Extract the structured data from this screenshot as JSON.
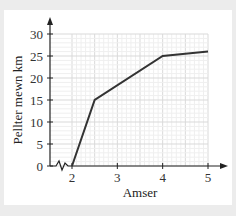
{
  "chart_data": {
    "type": "line",
    "title": "",
    "xlabel": "Amser",
    "ylabel": "Pellter mewn km",
    "x": [
      2,
      2.5,
      4,
      5
    ],
    "series": [
      {
        "name": "Pellter",
        "values": [
          0,
          15,
          25,
          26
        ]
      }
    ],
    "xticks": [
      "2",
      "3",
      "4",
      "5"
    ],
    "yticks": [
      "0",
      "5",
      "10",
      "15",
      "20",
      "25",
      "30"
    ],
    "xlim": [
      1.5,
      5.3
    ],
    "ylim": [
      0,
      32
    ],
    "grid": true,
    "axis_break_x": true,
    "line_color": "#333333",
    "grid_color": "#e6e6e6"
  }
}
